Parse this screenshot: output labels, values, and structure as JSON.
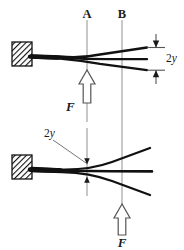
{
  "figure": {
    "colors": {
      "ink": "#1a1a1a",
      "beam": "#111111",
      "gridline": "#9a9a9a",
      "hatch": "#111111",
      "background": "#ffffff"
    },
    "gridlines": [
      {
        "id": "A",
        "label": "A",
        "x": 87
      },
      {
        "id": "B",
        "label": "B",
        "x": 122
      }
    ],
    "panels": [
      {
        "id": "top-panel",
        "name": "top-beam-diagram",
        "support": {
          "type": "fixed-hatched-block",
          "x": 12,
          "y": 42,
          "width": 20,
          "height": 24
        },
        "load": {
          "label": "F",
          "direction": "up",
          "x": 87,
          "label_position": "left"
        },
        "dimension": {
          "label": "2y",
          "x": 160,
          "y_top": 47,
          "y_bottom": 70
        },
        "beam_lines": 3
      },
      {
        "id": "bottom-panel",
        "name": "bottom-beam-diagram",
        "support": {
          "type": "fixed-hatched-block",
          "x": 12,
          "y": 155,
          "width": 20,
          "height": 24
        },
        "load": {
          "label": "F",
          "direction": "up",
          "x": 122,
          "label_position": "below"
        },
        "dimension": {
          "label": "2y",
          "x": 53,
          "y": 135,
          "leader_to_x": 87
        },
        "beam_lines": 3
      }
    ],
    "labels": {
      "line_a": "A",
      "line_b": "B",
      "force_top": "F",
      "force_bottom": "F",
      "deflection_top": "2y",
      "deflection_bottom": "2y",
      "deflection_prefix": "2",
      "deflection_symbol": "y"
    }
  }
}
